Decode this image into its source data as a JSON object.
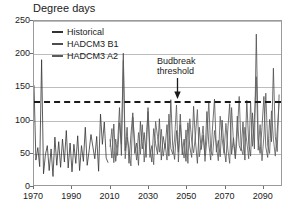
{
  "chart_data": {
    "type": "line",
    "title": "Degree days",
    "xlabel": "",
    "ylabel": "Degree days",
    "xlim": [
      1970,
      2100
    ],
    "ylim": [
      0,
      250
    ],
    "xticks": [
      1970,
      1990,
      2010,
      2030,
      2050,
      2070,
      2090
    ],
    "yticks": [
      0,
      50,
      100,
      150,
      200,
      250
    ],
    "grid": true,
    "legend_position": "top-left",
    "annotations": [
      {
        "text_line1": "Budbreak",
        "text_line2": "threshold",
        "target_value": 130,
        "target_year": 2043,
        "arrow": "down-arrow-icon"
      }
    ],
    "threshold": {
      "label": "Budbreak threshold",
      "value": 130,
      "style": "dashed",
      "color": "#1a1a1a"
    },
    "series": [
      {
        "name": "Historical",
        "color": "#333333",
        "x_start": 1970,
        "x_end": 2009,
        "values": [
          152,
          38,
          57,
          28,
          191,
          17,
          46,
          60,
          22,
          55,
          13,
          73,
          30,
          66,
          27,
          70,
          35,
          83,
          26,
          64,
          20,
          62,
          33,
          75,
          22,
          60,
          36,
          88,
          30,
          52,
          77,
          58,
          40,
          74,
          21,
          108,
          62,
          96,
          41,
          34
        ]
      },
      {
        "name": "HADCM3 B1",
        "color": "#4d4d4d",
        "x_start": 2010,
        "x_end": 2099,
        "values": [
          70,
          41,
          93,
          36,
          62,
          118,
          45,
          201,
          52,
          88,
          33,
          76,
          110,
          48,
          64,
          30,
          97,
          55,
          80,
          42,
          118,
          57,
          35,
          86,
          63,
          47,
          101,
          38,
          74,
          56,
          92,
          44,
          130,
          60,
          39,
          83,
          50,
          108,
          46,
          70,
          36,
          95,
          58,
          42,
          120,
          66,
          33,
          88,
          54,
          76,
          45,
          112,
          62,
          38,
          90,
          131,
          50,
          68,
          43,
          99,
          57,
          35,
          85,
          124,
          47,
          72,
          40,
          105,
          60,
          52,
          96,
          38,
          129,
          64,
          44,
          110,
          55,
          230,
          70,
          48,
          88,
          135,
          58,
          42,
          100,
          66,
          178,
          74,
          51,
          138
        ]
      },
      {
        "name": "HADCM3 A2",
        "color": "#5a5a5a",
        "x_start": 2010,
        "x_end": 2099,
        "values": [
          58,
          86,
          34,
          70,
          45,
          95,
          62,
          190,
          40,
          73,
          55,
          29,
          104,
          66,
          38,
          80,
          47,
          92,
          35,
          68,
          112,
          42,
          60,
          31,
          97,
          74,
          50,
          85,
          44,
          63,
          38,
          108,
          56,
          47,
          70,
          122,
          35,
          92,
          59,
          41,
          84,
          33,
          101,
          67,
          49,
          76,
          115,
          43,
          62,
          90,
          36,
          70,
          128,
          52,
          45,
          83,
          60,
          37,
          105,
          71,
          48,
          94,
          55,
          33,
          118,
          64,
          41,
          78,
          135,
          57,
          46,
          88,
          66,
          40,
          126,
          59,
          100,
          165,
          53,
          92,
          37,
          75,
          140,
          61,
          48,
          113,
          70,
          44,
          82,
          125
        ]
      }
    ]
  },
  "legend": {
    "items": [
      {
        "label": "Historical",
        "color": "#333333"
      },
      {
        "label": "HADCM3 B1",
        "color": "#4d4d4d"
      },
      {
        "label": "HADCM3 A2",
        "color": "#5a5a5a"
      }
    ]
  },
  "annotation": {
    "line1": "Budbreak",
    "line2": "threshold"
  },
  "axes": {
    "y_labels": [
      "250",
      "200",
      "150",
      "100",
      "50",
      "0"
    ],
    "x_labels": [
      "1970",
      "1990",
      "2010",
      "2030",
      "2050",
      "2070",
      "2090"
    ]
  },
  "colors": {
    "axis": "#9a9a9a",
    "grid": "#bdbdbd",
    "text": "#1a1a1a",
    "threshold": "#1a1a1a",
    "background": "#ffffff"
  }
}
